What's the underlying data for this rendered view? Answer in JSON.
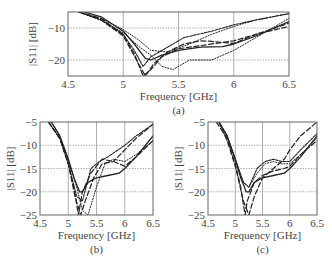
{
  "chart_data": [
    {
      "id": "a",
      "type": "line",
      "caption": "(a)",
      "xlabel": "Frequency [GHz]",
      "ylabel": "|S11| [dB]",
      "xlim": [
        4.5,
        6.5
      ],
      "ylim": [
        -25,
        -5
      ],
      "xticks": [
        4.5,
        5,
        5.5,
        6,
        6.5
      ],
      "xtick_labels": [
        "4.5",
        "5",
        "5.5",
        "6",
        "6.5"
      ],
      "yticks": [
        -10,
        -20
      ],
      "ytick_labels": [
        "−10",
        "−20"
      ],
      "grid": true,
      "frame": {
        "x0": 68,
        "x1": 289,
        "y0": 12,
        "y1": 76
      },
      "series": [
        {
          "name": "solid",
          "style": "solid",
          "x": [
            4.65,
            4.8,
            5.0,
            5.1,
            5.2,
            5.25,
            5.35,
            5.5,
            5.7,
            5.9,
            6.0,
            6.2,
            6.5
          ],
          "y": [
            -5,
            -6.5,
            -11,
            -15,
            -19.5,
            -20,
            -18.5,
            -17,
            -16,
            -15.8,
            -15,
            -12.5,
            -8
          ]
        },
        {
          "name": "dashed-1",
          "style": "dashed",
          "x": [
            4.6,
            4.8,
            5.0,
            5.1,
            5.18,
            5.25,
            5.35,
            5.5,
            5.7,
            5.9,
            6.0,
            6.2,
            6.5
          ],
          "y": [
            -5,
            -7,
            -12,
            -18,
            -25,
            -23,
            -19,
            -16.5,
            -15.5,
            -14.5,
            -14,
            -12,
            -9.5
          ]
        },
        {
          "name": "dashed-2",
          "style": "dashed",
          "x": [
            4.6,
            4.8,
            5.0,
            5.12,
            5.2,
            5.28,
            5.4,
            5.55,
            5.7,
            5.8,
            5.9,
            6.0,
            6.2,
            6.5
          ],
          "y": [
            -5,
            -7.5,
            -12.5,
            -20,
            -25,
            -21,
            -17.5,
            -15,
            -14,
            -14.2,
            -14.5,
            -14.8,
            -12,
            -8.5
          ]
        },
        {
          "name": "dotted-1",
          "style": "dotted",
          "x": [
            4.6,
            4.8,
            5.0,
            5.15,
            5.25,
            5.4,
            5.6,
            5.8,
            6.0,
            6.2,
            6.5
          ],
          "y": [
            -5,
            -7,
            -10.5,
            -14,
            -17,
            -17.5,
            -15,
            -12,
            -9.5,
            -7.5,
            -5.5
          ]
        },
        {
          "name": "dotted-2",
          "style": "dotted",
          "x": [
            4.6,
            4.8,
            5.0,
            5.15,
            5.25,
            5.35,
            5.45,
            5.6,
            5.8,
            6.0,
            6.2,
            6.5
          ],
          "y": [
            -5,
            -7.5,
            -11.5,
            -16,
            -18.5,
            -22,
            -23,
            -20,
            -20,
            -17,
            -13,
            -7
          ]
        },
        {
          "name": "dash-dense",
          "style": "dense-dash",
          "x": [
            4.6,
            4.8,
            5.0,
            5.1,
            5.18,
            5.25,
            5.4,
            5.55,
            5.8,
            6.0,
            6.2,
            6.5
          ],
          "y": [
            -5,
            -7.5,
            -12,
            -17,
            -22,
            -19,
            -16,
            -13,
            -11,
            -9,
            -7.5,
            -5.5
          ]
        }
      ]
    },
    {
      "id": "b",
      "type": "line",
      "caption": "(b)",
      "xlabel": "Frequency [GHz]",
      "ylabel": "|S11| [dB]",
      "xlim": [
        4.5,
        6.5
      ],
      "ylim": [
        -25,
        -5
      ],
      "xticks": [
        4.5,
        5,
        5.5,
        6,
        6.5
      ],
      "xtick_labels": [
        "4.5",
        "5",
        "5.5",
        "6",
        "6.5"
      ],
      "yticks": [
        -5,
        -10,
        -15,
        -20,
        -25
      ],
      "ytick_labels": [
        "−5",
        "−10",
        "−15",
        "−20",
        "−25"
      ],
      "grid": true,
      "frame": {
        "x0": 40,
        "x1": 153,
        "y0": 122,
        "y1": 215
      },
      "series": [
        {
          "name": "solid",
          "style": "solid",
          "x": [
            4.7,
            4.85,
            5.0,
            5.1,
            5.2,
            5.25,
            5.35,
            5.5,
            5.7,
            5.9,
            6.0,
            6.2,
            6.5
          ],
          "y": [
            -5,
            -8,
            -13,
            -17,
            -20,
            -20,
            -18,
            -17,
            -16.5,
            -16,
            -15,
            -12.5,
            -8
          ]
        },
        {
          "name": "dashed-1",
          "style": "dashed",
          "x": [
            4.65,
            4.85,
            5.0,
            5.1,
            5.18,
            5.25,
            5.4,
            5.6,
            5.8,
            6.0,
            6.2,
            6.5
          ],
          "y": [
            -5,
            -8.5,
            -14,
            -19,
            -25,
            -20,
            -16,
            -13,
            -13.5,
            -14.5,
            -12.5,
            -9
          ]
        },
        {
          "name": "dashed-2",
          "style": "dashed",
          "x": [
            4.65,
            4.85,
            5.0,
            5.12,
            5.22,
            5.3,
            5.45,
            5.6,
            5.8,
            6.0,
            6.2,
            6.5
          ],
          "y": [
            -5,
            -8.5,
            -14,
            -21,
            -25,
            -22,
            -17,
            -14,
            -13.5,
            -11,
            -8.5,
            -5.5
          ]
        },
        {
          "name": "dotted-1",
          "style": "dotted",
          "x": [
            4.7,
            4.85,
            5.0,
            5.15,
            5.25,
            5.35,
            5.5,
            5.65,
            5.8,
            6.0,
            6.2,
            6.5
          ],
          "y": [
            -5,
            -8,
            -13,
            -19,
            -24,
            -25,
            -19,
            -14,
            -13,
            -13.5,
            -12,
            -9
          ]
        },
        {
          "name": "dash-dense",
          "style": "dense-dash",
          "x": [
            4.65,
            4.85,
            5.0,
            5.15,
            5.25,
            5.4,
            5.55,
            5.7,
            6.0,
            6.2,
            6.5
          ],
          "y": [
            -5,
            -8.5,
            -14,
            -21,
            -22,
            -15,
            -13.5,
            -12.5,
            -10,
            -8,
            -5.5
          ]
        }
      ]
    },
    {
      "id": "c",
      "type": "line",
      "caption": "(c)",
      "xlabel": "Frequency [GHz]",
      "ylabel": "|S11| [dB]",
      "xlim": [
        4.5,
        6.5
      ],
      "ylim": [
        -25,
        -5
      ],
      "xticks": [
        4.5,
        5,
        5.5,
        6,
        6.5
      ],
      "xtick_labels": [
        "4.5",
        "5",
        "5.5",
        "6",
        "6.5"
      ],
      "yticks": [
        -5,
        -10,
        -15,
        -20,
        -25
      ],
      "ytick_labels": [
        "−5",
        "−10",
        "−15",
        "−20",
        "−25"
      ],
      "grid": true,
      "frame": {
        "x0": 208,
        "x1": 317,
        "y0": 122,
        "y1": 215
      },
      "series": [
        {
          "name": "solid",
          "style": "solid",
          "x": [
            4.7,
            4.85,
            5.0,
            5.1,
            5.2,
            5.25,
            5.35,
            5.5,
            5.7,
            5.9,
            6.0,
            6.2,
            6.5
          ],
          "y": [
            -5,
            -8,
            -13,
            -17,
            -20,
            -20,
            -18,
            -17,
            -16.5,
            -16,
            -15,
            -12.5,
            -8
          ]
        },
        {
          "name": "dashed-1",
          "style": "dashed",
          "x": [
            4.65,
            4.85,
            5.0,
            5.1,
            5.18,
            5.22,
            5.35,
            5.5,
            5.7,
            5.9,
            6.0,
            6.2,
            6.5
          ],
          "y": [
            -5,
            -8.5,
            -14,
            -19,
            -25,
            -22,
            -18,
            -16.5,
            -15.5,
            -15,
            -14.5,
            -12,
            -9
          ]
        },
        {
          "name": "dashed-2",
          "style": "dashed",
          "x": [
            4.7,
            4.85,
            5.0,
            5.15,
            5.25,
            5.35,
            5.5,
            5.7,
            5.9,
            6.0,
            6.2,
            6.5
          ],
          "y": [
            -5,
            -9,
            -14.5,
            -22,
            -25,
            -21,
            -17,
            -15,
            -13,
            -11,
            -8,
            -5
          ]
        },
        {
          "name": "dotted-1",
          "style": "dotted",
          "x": [
            4.7,
            4.85,
            5.0,
            5.15,
            5.25,
            5.4,
            5.55,
            5.7,
            5.85,
            6.0,
            6.2,
            6.5
          ],
          "y": [
            -5,
            -8,
            -13,
            -18,
            -19,
            -16,
            -14,
            -13.5,
            -14,
            -14,
            -12,
            -8.5
          ]
        },
        {
          "name": "dash-dense",
          "style": "dense-dash",
          "x": [
            4.7,
            4.85,
            5.0,
            5.15,
            5.25,
            5.4,
            5.55,
            5.7,
            5.85,
            6.0,
            6.2,
            6.5
          ],
          "y": [
            -5,
            -8,
            -13,
            -18,
            -19,
            -15,
            -13.5,
            -13,
            -13.5,
            -13.5,
            -11,
            -7.5
          ]
        }
      ]
    }
  ]
}
